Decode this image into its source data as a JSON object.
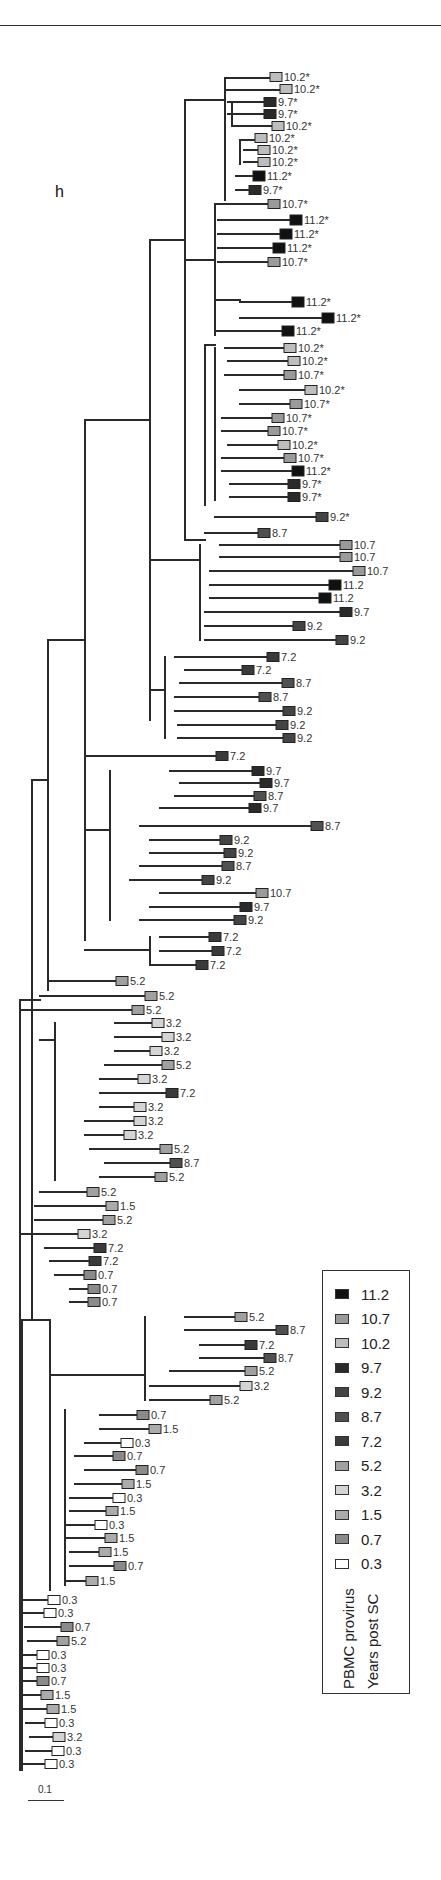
{
  "figure": {
    "panel_label": "h",
    "scale_bar_label": "0.1"
  },
  "legend": {
    "title_line1": "PBMC provirus",
    "title_line2": "Years post SC",
    "items": [
      {
        "label": "11.2",
        "color": "#111111"
      },
      {
        "label": "10.7",
        "color": "#9a9a9a"
      },
      {
        "label": "10.2",
        "color": "#bdbdbd"
      },
      {
        "label": "9.7",
        "color": "#2a2a2a"
      },
      {
        "label": "9.2",
        "color": "#444444"
      },
      {
        "label": "8.7",
        "color": "#505050"
      },
      {
        "label": "7.2",
        "color": "#3a3a3a"
      },
      {
        "label": "5.2",
        "color": "#a0a0a0"
      },
      {
        "label": "3.2",
        "color": "#d4d4d4"
      },
      {
        "label": "1.5",
        "color": "#ababab"
      },
      {
        "label": "0.7",
        "color": "#8a8a8a"
      },
      {
        "label": "0.3",
        "color": "#ffffff"
      }
    ]
  },
  "tips": [
    {
      "x": 270,
      "y": 77,
      "label": "10.2*"
    },
    {
      "x": 280,
      "y": 89,
      "label": "10.2*"
    },
    {
      "x": 264,
      "y": 102,
      "label": "9.7*"
    },
    {
      "x": 264,
      "y": 114,
      "label": "9.7*"
    },
    {
      "x": 272,
      "y": 126,
      "label": "10.2*"
    },
    {
      "x": 255,
      "y": 138,
      "label": "10.2*"
    },
    {
      "x": 258,
      "y": 150,
      "label": "10.2*"
    },
    {
      "x": 258,
      "y": 162,
      "label": "10.2*"
    },
    {
      "x": 253,
      "y": 176,
      "label": "11.2*"
    },
    {
      "x": 249,
      "y": 190,
      "label": "9.7*"
    },
    {
      "x": 268,
      "y": 204,
      "label": "10.7*"
    },
    {
      "x": 290,
      "y": 220,
      "label": "11.2*"
    },
    {
      "x": 280,
      "y": 234,
      "label": "11.2*"
    },
    {
      "x": 273,
      "y": 248,
      "label": "11.2*"
    },
    {
      "x": 268,
      "y": 262,
      "label": "10.7*"
    },
    {
      "x": 292,
      "y": 302,
      "label": "11.2*"
    },
    {
      "x": 322,
      "y": 318,
      "label": "11.2*"
    },
    {
      "x": 282,
      "y": 331,
      "label": "11.2*"
    },
    {
      "x": 284,
      "y": 348,
      "label": "10.2*"
    },
    {
      "x": 288,
      "y": 361,
      "label": "10.2*"
    },
    {
      "x": 284,
      "y": 375,
      "label": "10.7*"
    },
    {
      "x": 305,
      "y": 390,
      "label": "10.2*"
    },
    {
      "x": 290,
      "y": 404,
      "label": "10.7*"
    },
    {
      "x": 272,
      "y": 418,
      "label": "10.7*"
    },
    {
      "x": 268,
      "y": 431,
      "label": "10.7*"
    },
    {
      "x": 278,
      "y": 445,
      "label": "10.2*"
    },
    {
      "x": 284,
      "y": 458,
      "label": "10.7*"
    },
    {
      "x": 292,
      "y": 471,
      "label": "11.2*"
    },
    {
      "x": 288,
      "y": 484,
      "label": "9.7*"
    },
    {
      "x": 288,
      "y": 497,
      "label": "9.7*"
    },
    {
      "x": 316,
      "y": 517,
      "label": "9.2*"
    },
    {
      "x": 258,
      "y": 533,
      "label": "8.7"
    },
    {
      "x": 340,
      "y": 545,
      "label": "10.7"
    },
    {
      "x": 340,
      "y": 557,
      "label": "10.7"
    },
    {
      "x": 353,
      "y": 571,
      "label": "10.7"
    },
    {
      "x": 329,
      "y": 585,
      "label": "11.2"
    },
    {
      "x": 319,
      "y": 598,
      "label": "11.2"
    },
    {
      "x": 340,
      "y": 612,
      "label": "9.7"
    },
    {
      "x": 293,
      "y": 626,
      "label": "9.2"
    },
    {
      "x": 336,
      "y": 640,
      "label": "9.2"
    },
    {
      "x": 267,
      "y": 657,
      "label": "7.2"
    },
    {
      "x": 242,
      "y": 670,
      "label": "7.2"
    },
    {
      "x": 282,
      "y": 683,
      "label": "8.7"
    },
    {
      "x": 259,
      "y": 697,
      "label": "8.7"
    },
    {
      "x": 283,
      "y": 711,
      "label": "9.2"
    },
    {
      "x": 276,
      "y": 725,
      "label": "9.2"
    },
    {
      "x": 283,
      "y": 738,
      "label": "9.2"
    },
    {
      "x": 216,
      "y": 756,
      "label": "7.2"
    },
    {
      "x": 252,
      "y": 771,
      "label": "9.7"
    },
    {
      "x": 260,
      "y": 783,
      "label": "9.7"
    },
    {
      "x": 254,
      "y": 796,
      "label": "8.7"
    },
    {
      "x": 249,
      "y": 808,
      "label": "9.7"
    },
    {
      "x": 311,
      "y": 826,
      "label": "8.7"
    },
    {
      "x": 220,
      "y": 840,
      "label": "9.2"
    },
    {
      "x": 224,
      "y": 853,
      "label": "9.2"
    },
    {
      "x": 222,
      "y": 866,
      "label": "8.7"
    },
    {
      "x": 202,
      "y": 880,
      "label": "9.2"
    },
    {
      "x": 256,
      "y": 893,
      "label": "10.7"
    },
    {
      "x": 240,
      "y": 907,
      "label": "9.7"
    },
    {
      "x": 234,
      "y": 920,
      "label": "9.2"
    },
    {
      "x": 209,
      "y": 937,
      "label": "7.2"
    },
    {
      "x": 212,
      "y": 951,
      "label": "7.2"
    },
    {
      "x": 196,
      "y": 965,
      "label": "7.2"
    },
    {
      "x": 116,
      "y": 981,
      "label": "5.2"
    },
    {
      "x": 145,
      "y": 996,
      "label": "5.2"
    },
    {
      "x": 132,
      "y": 1010,
      "label": "5.2"
    },
    {
      "x": 152,
      "y": 1023,
      "label": "3.2"
    },
    {
      "x": 162,
      "y": 1037,
      "label": "3.2"
    },
    {
      "x": 150,
      "y": 1051,
      "label": "3.2"
    },
    {
      "x": 162,
      "y": 1065,
      "label": "5.2"
    },
    {
      "x": 138,
      "y": 1079,
      "label": "3.2"
    },
    {
      "x": 166,
      "y": 1093,
      "label": "7.2"
    },
    {
      "x": 134,
      "y": 1107,
      "label": "3.2"
    },
    {
      "x": 134,
      "y": 1121,
      "label": "3.2"
    },
    {
      "x": 124,
      "y": 1135,
      "label": "3.2"
    },
    {
      "x": 160,
      "y": 1149,
      "label": "5.2"
    },
    {
      "x": 170,
      "y": 1163,
      "label": "8.7"
    },
    {
      "x": 155,
      "y": 1177,
      "label": "5.2"
    },
    {
      "x": 87,
      "y": 1192,
      "label": "5.2"
    },
    {
      "x": 106,
      "y": 1206,
      "label": "1.5"
    },
    {
      "x": 103,
      "y": 1220,
      "label": "5.2"
    },
    {
      "x": 78,
      "y": 1234,
      "label": "3.2"
    },
    {
      "x": 94,
      "y": 1248,
      "label": "7.2"
    },
    {
      "x": 89,
      "y": 1261,
      "label": "7.2"
    },
    {
      "x": 84,
      "y": 1275,
      "label": "0.7"
    },
    {
      "x": 88,
      "y": 1289,
      "label": "0.7"
    },
    {
      "x": 88,
      "y": 1302,
      "label": "0.7"
    },
    {
      "x": 235,
      "y": 1317,
      "label": "5.2"
    },
    {
      "x": 276,
      "y": 1330,
      "label": "8.7"
    },
    {
      "x": 245,
      "y": 1345,
      "label": "7.2"
    },
    {
      "x": 264,
      "y": 1358,
      "label": "8.7"
    },
    {
      "x": 245,
      "y": 1371,
      "label": "5.2"
    },
    {
      "x": 240,
      "y": 1386,
      "label": "3.2"
    },
    {
      "x": 210,
      "y": 1400,
      "label": "5.2"
    },
    {
      "x": 137,
      "y": 1415,
      "label": "0.7"
    },
    {
      "x": 149,
      "y": 1429,
      "label": "1.5"
    },
    {
      "x": 121,
      "y": 1443,
      "label": "0.3"
    },
    {
      "x": 113,
      "y": 1456,
      "label": "0.7"
    },
    {
      "x": 136,
      "y": 1470,
      "label": "0.7"
    },
    {
      "x": 122,
      "y": 1484,
      "label": "1.5"
    },
    {
      "x": 113,
      "y": 1498,
      "label": "0.3"
    },
    {
      "x": 106,
      "y": 1511,
      "label": "1.5"
    },
    {
      "x": 95,
      "y": 1525,
      "label": "0.3"
    },
    {
      "x": 105,
      "y": 1538,
      "label": "1.5"
    },
    {
      "x": 99,
      "y": 1552,
      "label": "1.5"
    },
    {
      "x": 114,
      "y": 1566,
      "label": "0.7"
    },
    {
      "x": 86,
      "y": 1581,
      "label": "1.5"
    },
    {
      "x": 48,
      "y": 1600,
      "label": "0.3"
    },
    {
      "x": 44,
      "y": 1613,
      "label": "0.3"
    },
    {
      "x": 61,
      "y": 1627,
      "label": "0.7"
    },
    {
      "x": 57,
      "y": 1641,
      "label": "5.2"
    },
    {
      "x": 37,
      "y": 1655,
      "label": "0.3"
    },
    {
      "x": 37,
      "y": 1668,
      "label": "0.3"
    },
    {
      "x": 37,
      "y": 1681,
      "label": "0.7"
    },
    {
      "x": 41,
      "y": 1695,
      "label": "1.5"
    },
    {
      "x": 47,
      "y": 1709,
      "label": "1.5"
    },
    {
      "x": 45,
      "y": 1723,
      "label": "0.3"
    },
    {
      "x": 53,
      "y": 1737,
      "label": "3.2"
    },
    {
      "x": 52,
      "y": 1751,
      "label": "0.3"
    },
    {
      "x": 45,
      "y": 1764,
      "label": "0.3"
    }
  ]
}
